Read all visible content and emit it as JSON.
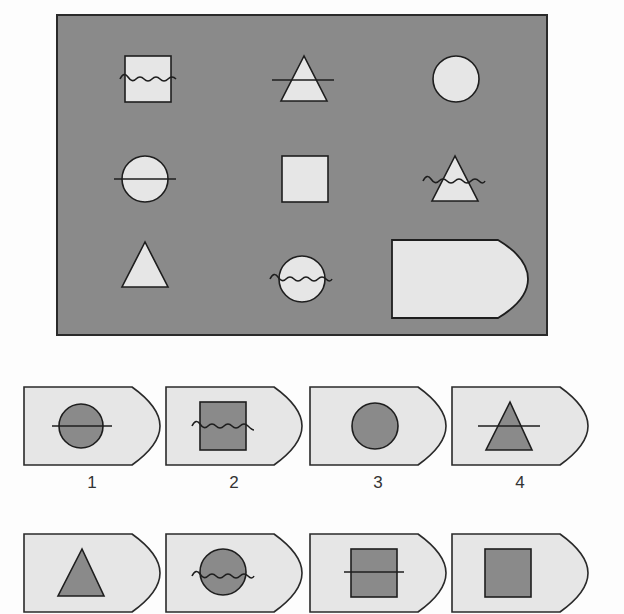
{
  "puzzle": {
    "matrix": {
      "background_color": "#8a8a8a",
      "shape_fill": "#e6e6e6",
      "stroke": "#1e1e1e",
      "cells": [
        {
          "row": 1,
          "col": 1,
          "shape": "square",
          "overlay": "wave"
        },
        {
          "row": 1,
          "col": 2,
          "shape": "triangle",
          "overlay": "line"
        },
        {
          "row": 1,
          "col": 3,
          "shape": "circle",
          "overlay": "none"
        },
        {
          "row": 2,
          "col": 1,
          "shape": "circle",
          "overlay": "line"
        },
        {
          "row": 2,
          "col": 2,
          "shape": "square",
          "overlay": "none"
        },
        {
          "row": 2,
          "col": 3,
          "shape": "triangle",
          "overlay": "wave"
        },
        {
          "row": 3,
          "col": 1,
          "shape": "triangle",
          "overlay": "none"
        },
        {
          "row": 3,
          "col": 2,
          "shape": "circle",
          "overlay": "wave"
        },
        {
          "row": 3,
          "col": 3,
          "shape": "blank-answer-tile",
          "overlay": "none"
        }
      ]
    },
    "options": {
      "tile_fill": "#e6e6e6",
      "shape_fill": "#8a8a8a",
      "items": [
        {
          "label": "1",
          "shape": "circle",
          "overlay": "line"
        },
        {
          "label": "2",
          "shape": "square",
          "overlay": "wave"
        },
        {
          "label": "3",
          "shape": "circle",
          "overlay": "none"
        },
        {
          "label": "4",
          "shape": "triangle",
          "overlay": "line"
        },
        {
          "label": "5",
          "shape": "triangle",
          "overlay": "none"
        },
        {
          "label": "6",
          "shape": "circle",
          "overlay": "wave"
        },
        {
          "label": "7",
          "shape": "square",
          "overlay": "line"
        },
        {
          "label": "8",
          "shape": "square",
          "overlay": "none"
        }
      ]
    }
  }
}
